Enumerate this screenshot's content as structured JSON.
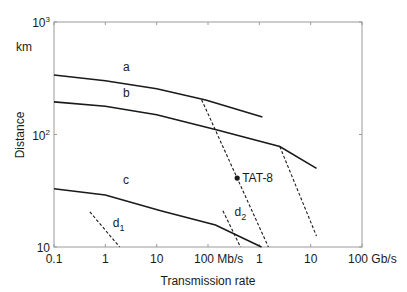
{
  "chart_data": {
    "type": "line",
    "title": "",
    "xlabel": "Transmission rate",
    "ylabel": "Distance",
    "y_unit_label": "km",
    "x_scale": "log",
    "y_scale": "log",
    "x_unit": "Mb/s",
    "xlim": [
      0.1,
      100000
    ],
    "ylim": [
      10,
      1000
    ],
    "grid": false,
    "x_ticks": [
      {
        "value": 0.1,
        "label": "0.1"
      },
      {
        "value": 1,
        "label": "1"
      },
      {
        "value": 10,
        "label": "10"
      },
      {
        "value": 100,
        "label": "100 Mb/s"
      },
      {
        "value": 1000,
        "label": "1"
      },
      {
        "value": 10000,
        "label": "10"
      },
      {
        "value": 100000,
        "label": "100 Gb/s"
      }
    ],
    "y_ticks": [
      {
        "value": 10,
        "label": "10",
        "base": "10",
        "exp": ""
      },
      {
        "value": 100,
        "label": "10^2",
        "base": "10",
        "exp": "2"
      },
      {
        "value": 1000,
        "label": "10^3",
        "base": "10",
        "exp": "3"
      }
    ],
    "series": [
      {
        "name": "a",
        "style": "solid",
        "label_at": {
          "x": 2.2,
          "y": 370
        },
        "points": [
          [
            0.1,
            338
          ],
          [
            1,
            300
          ],
          [
            10,
            255
          ],
          [
            90,
            203
          ],
          [
            1150,
            143
          ]
        ]
      },
      {
        "name": "b",
        "style": "solid",
        "label_at": {
          "x": 2.2,
          "y": 215
        },
        "points": [
          [
            0.1,
            195
          ],
          [
            1,
            178
          ],
          [
            10,
            150
          ],
          [
            145,
            110
          ],
          [
            2500,
            78
          ],
          [
            13000,
            50
          ]
        ]
      },
      {
        "name": "c",
        "style": "solid",
        "label_at": {
          "x": 2.2,
          "y": 36
        },
        "points": [
          [
            0.1,
            33
          ],
          [
            1,
            29
          ],
          [
            12,
            21
          ],
          [
            140,
            15.7
          ],
          [
            1100,
            10
          ]
        ]
      },
      {
        "name": "d1",
        "style": "dashed",
        "label_at": {
          "x": 1.4,
          "y": 15
        },
        "subscript": "1",
        "points": [
          [
            0.5,
            20.5
          ],
          [
            1.9,
            10
          ]
        ]
      },
      {
        "name": "d2",
        "style": "dashed",
        "label_at": {
          "x": 330,
          "y": 19
        },
        "subscript": "2",
        "points": [
          [
            195,
            21
          ],
          [
            430,
            10
          ]
        ]
      },
      {
        "name": "TAT-8 limit",
        "style": "dashed",
        "label_at": null,
        "points": [
          [
            75,
            204
          ],
          [
            1500,
            10
          ]
        ]
      },
      {
        "name": "high-rate limit",
        "style": "dashed",
        "label_at": null,
        "points": [
          [
            2500,
            78
          ],
          [
            13000,
            12.5
          ]
        ]
      }
    ],
    "annotations": [
      {
        "text": "TAT-8",
        "x": 370,
        "y": 41,
        "marker": "dot"
      }
    ]
  }
}
